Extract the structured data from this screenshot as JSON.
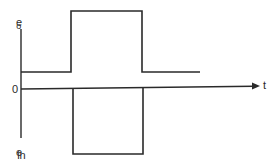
{
  "diagram": {
    "labels": {
      "output": {
        "main": "e",
        "sub": "o"
      },
      "input": {
        "main": "e",
        "sub": "in"
      },
      "origin": "0",
      "time_axis": "t"
    },
    "colors": {
      "stroke": "#2a2a2a",
      "background": "#ffffff"
    },
    "geometry": {
      "vertical_axis": {
        "x": 21,
        "y_top": 29,
        "y_bottom": 138
      },
      "time_axis": {
        "x_start": 21,
        "y_start": 89,
        "x_end": 259,
        "y_end": 86
      },
      "output_pulse": {
        "baseline_y": 72,
        "high_y": 11,
        "x_start": 21,
        "rise_x": 71,
        "fall_x": 142,
        "x_end": 200
      },
      "input_pulse": {
        "baseline_y": 89,
        "low_y": 154,
        "fall_x": 73,
        "rise_x": 143
      }
    }
  }
}
